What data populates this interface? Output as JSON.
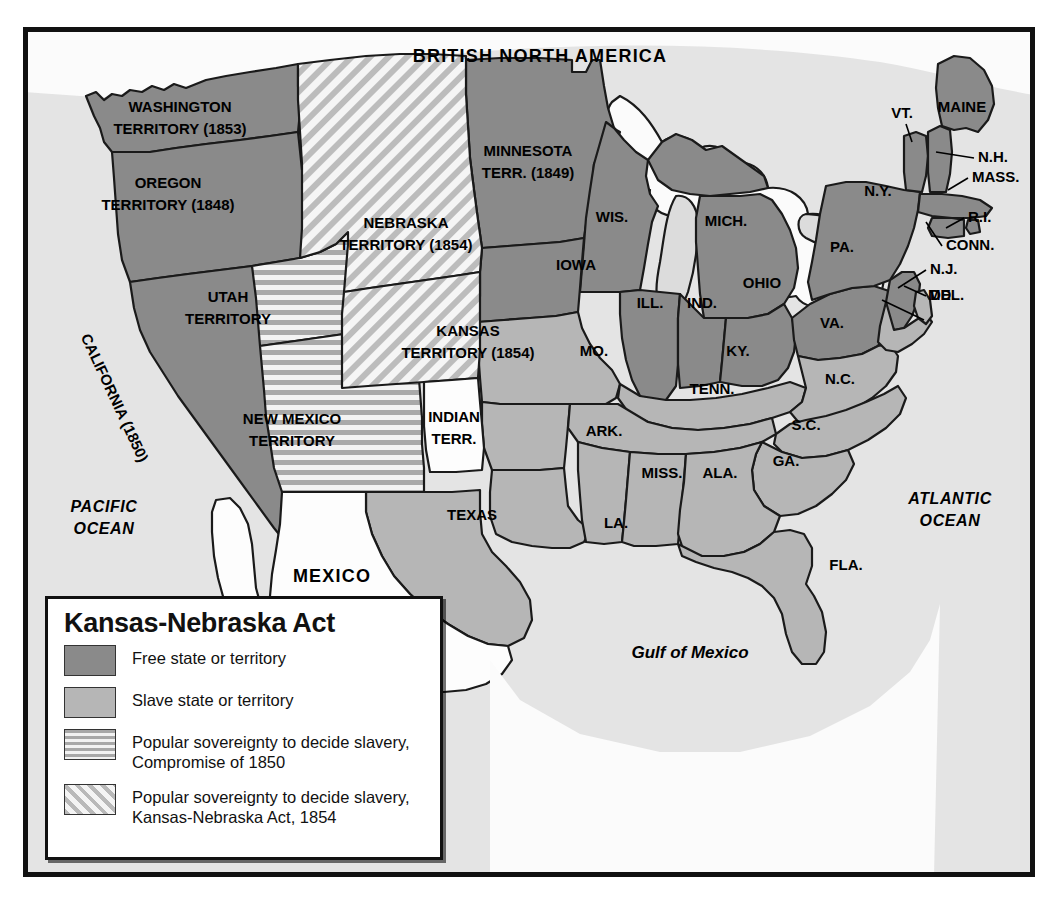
{
  "map": {
    "title_visible": "Kansas-Nebraska Act",
    "country_labels": [
      {
        "name": "british-north-america",
        "text": "BRITISH NORTH AMERICA"
      },
      {
        "name": "mexico",
        "text": "MEXICO"
      }
    ],
    "water_labels": [
      {
        "name": "pacific-ocean",
        "line1": "PACIFIC",
        "line2": "OCEAN"
      },
      {
        "name": "atlantic-ocean",
        "line1": "ATLANTIC",
        "line2": "OCEAN"
      },
      {
        "name": "gulf-of-mexico",
        "text": "Gulf of Mexico"
      }
    ],
    "territories": [
      {
        "name": "washington-territory",
        "line1": "WASHINGTON",
        "line2": "TERRITORY (1853)",
        "category": "free"
      },
      {
        "name": "oregon-territory",
        "line1": "OREGON",
        "line2": "TERRITORY (1848)",
        "category": "free"
      },
      {
        "name": "minnesota-territory",
        "line1": "MINNESOTA",
        "line2": "TERR. (1849)",
        "category": "free"
      },
      {
        "name": "utah-territory",
        "line1": "UTAH",
        "line2": "TERRITORY",
        "category": "compromise1850"
      },
      {
        "name": "new-mexico-territory",
        "line1": "NEW MEXICO",
        "line2": "TERRITORY",
        "category": "compromise1850"
      },
      {
        "name": "nebraska-territory",
        "line1": "NEBRASKA",
        "line2": "TERRITORY (1854)",
        "category": "kansas-nebraska"
      },
      {
        "name": "kansas-territory",
        "line1": "KANSAS",
        "line2": "TERRITORY (1854)",
        "category": "kansas-nebraska"
      },
      {
        "name": "indian-territory",
        "line1": "INDIAN",
        "line2": "TERR.",
        "category": "none"
      },
      {
        "name": "california",
        "text": "CALIFORNIA (1850)",
        "category": "free"
      }
    ],
    "free_states": [
      {
        "name": "wisconsin",
        "text": "WIS."
      },
      {
        "name": "iowa",
        "text": "IOWA"
      },
      {
        "name": "michigan",
        "text": "MICH."
      },
      {
        "name": "illinois",
        "text": "ILL."
      },
      {
        "name": "indiana",
        "text": "IND."
      },
      {
        "name": "ohio",
        "text": "OHIO"
      },
      {
        "name": "pennsylvania",
        "text": "PA."
      },
      {
        "name": "new-york",
        "text": "N.Y."
      },
      {
        "name": "maine",
        "text": "MAINE"
      },
      {
        "name": "vermont",
        "text": "VT."
      },
      {
        "name": "new-hampshire",
        "text": "N.H."
      },
      {
        "name": "massachusetts",
        "text": "MASS."
      },
      {
        "name": "rhode-island",
        "text": "R.I."
      },
      {
        "name": "connecticut",
        "text": "CONN."
      },
      {
        "name": "new-jersey",
        "text": "N.J."
      }
    ],
    "slave_states": [
      {
        "name": "missouri",
        "text": "MO."
      },
      {
        "name": "kentucky",
        "text": "KY."
      },
      {
        "name": "virginia",
        "text": "VA."
      },
      {
        "name": "maryland",
        "text": "MD."
      },
      {
        "name": "delaware",
        "text": "DEL."
      },
      {
        "name": "north-carolina",
        "text": "N.C."
      },
      {
        "name": "tennessee",
        "text": "TENN."
      },
      {
        "name": "south-carolina",
        "text": "S.C."
      },
      {
        "name": "georgia",
        "text": "GA."
      },
      {
        "name": "arkansas",
        "text": "ARK."
      },
      {
        "name": "mississippi",
        "text": "MISS."
      },
      {
        "name": "alabama",
        "text": "ALA."
      },
      {
        "name": "louisiana",
        "text": "LA."
      },
      {
        "name": "florida",
        "text": "FLA."
      },
      {
        "name": "texas",
        "text": "TEXAS"
      }
    ]
  },
  "legend": {
    "title": "Kansas-Nebraska Act",
    "items": [
      {
        "name": "legend-free",
        "swatch": "solid-dark-gray",
        "label": "Free state or territory"
      },
      {
        "name": "legend-slave",
        "swatch": "solid-light-gray",
        "label": "Slave state or territory"
      },
      {
        "name": "legend-compromise-1850",
        "swatch": "horizontal-stripes",
        "label_line1": "Popular sovereignty to decide slavery,",
        "label_line2": "Compromise of 1850"
      },
      {
        "name": "legend-kansas-nebraska",
        "swatch": "diagonal-stripes",
        "label_line1": "Popular sovereignty to decide slavery,",
        "label_line2": "Kansas-Nebraska Act, 1854"
      }
    ]
  },
  "colors": {
    "free": "#8a8a8a",
    "slave": "#b6b6b6",
    "ocean": "#e4e4e4",
    "unfilled": "#fdfdfd",
    "border": "#111111",
    "stroke": "#1a1a1a"
  }
}
